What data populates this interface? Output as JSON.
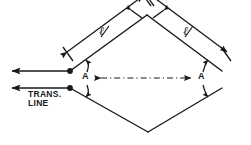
{
  "figure": {
    "background_color": "#ffffff",
    "line_color": "#1a1a1a",
    "width": 251,
    "height": 145
  },
  "labels": {
    "trans_line": "TRANS.\nLINE",
    "angle_left": "A",
    "angle_right": "A",
    "length_left": "ℓ",
    "length_right": "ℓ"
  },
  "geometry": {
    "left_vertex": {
      "x": 70,
      "y": 71
    },
    "left_vertex_lower": {
      "x": 70,
      "y": 88
    },
    "top_vertex": {
      "x": 147,
      "y": 15
    },
    "right_vertex": {
      "x": 222,
      "y": 71
    },
    "right_vertex_lower": {
      "x": 222,
      "y": 88
    },
    "bottom_vertex": {
      "x": 148,
      "y": 132
    },
    "feed_arrow_upper_end": {
      "x": 8,
      "y": 71
    },
    "feed_arrow_lower_end": {
      "x": 8,
      "y": 88
    },
    "centerline_start": {
      "x": 96,
      "y": 78
    },
    "centerline_end": {
      "x": 196,
      "y": 78
    }
  },
  "elements": {
    "upper_left_leg": "upper-left-leg",
    "upper_right_leg": "upper-right-leg",
    "lower_left_leg": "lower-left-leg",
    "lower_right_leg": "lower-right-leg",
    "dimension_line_left": "dimension-line-left",
    "dimension_line_right": "dimension-line-right",
    "centerline": "axis-centerline",
    "feed_line_upper": "feed-line-upper",
    "feed_line_lower": "feed-line-lower",
    "feed_point_upper": "feed-terminal-upper",
    "feed_point_lower": "feed-terminal-lower"
  }
}
